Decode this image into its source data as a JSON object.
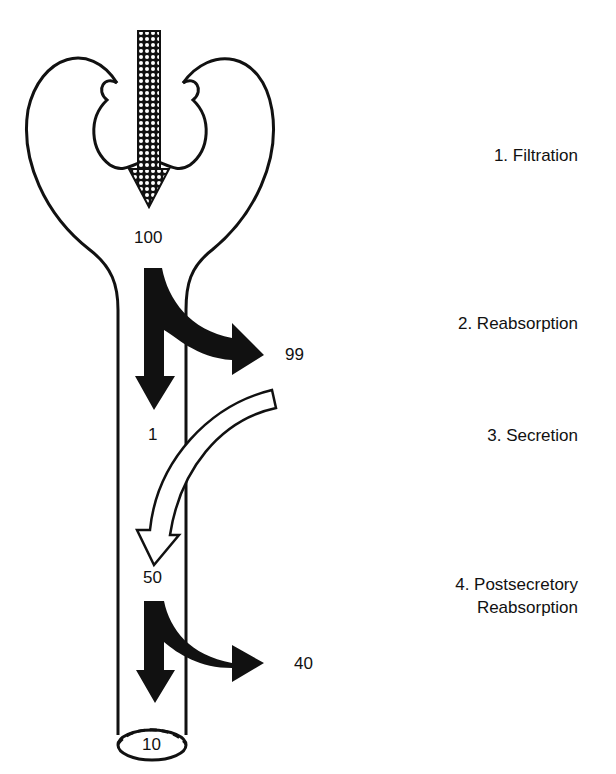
{
  "diagram": {
    "steps": [
      {
        "label": "1. Filtration"
      },
      {
        "label": "2. Reabsorption"
      },
      {
        "label": "3. Secretion"
      },
      {
        "label": "4. Postsecretory",
        "label2": "Reabsorption"
      }
    ],
    "values": {
      "filtered": "100",
      "reabsorbed": "99",
      "remaining_after_reabsorption": "1",
      "after_secretion": "50",
      "postsecretory_reabsorbed": "40",
      "excreted": "10"
    },
    "colors": {
      "outline": "#111111",
      "arrow_fill": "#111111",
      "background": "#ffffff"
    }
  }
}
